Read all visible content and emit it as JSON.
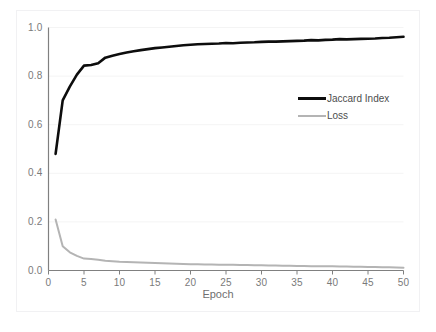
{
  "chart_data": {
    "type": "line",
    "title": "",
    "xlabel": "Epoch",
    "ylabel": "",
    "xlim": [
      0,
      50
    ],
    "ylim": [
      0,
      1.0
    ],
    "grid": true,
    "grid_axis": "y",
    "legend_position": "inside-upper-right",
    "x_ticks": [
      0,
      5,
      10,
      15,
      20,
      25,
      30,
      35,
      40,
      45,
      50
    ],
    "x_tick_labels": [
      "0",
      "5",
      "10",
      "15",
      "20",
      "25",
      "30",
      "35",
      "40",
      "45",
      "50"
    ],
    "y_ticks": [
      0.0,
      0.2,
      0.4,
      0.6,
      0.8,
      1.0
    ],
    "y_tick_labels": [
      "0.0",
      "0.2",
      "0.4",
      "0.6",
      "0.8",
      "1.0"
    ],
    "x": [
      1,
      2,
      3,
      4,
      5,
      6,
      7,
      8,
      9,
      10,
      11,
      12,
      13,
      14,
      15,
      16,
      17,
      18,
      19,
      20,
      21,
      22,
      23,
      24,
      25,
      26,
      27,
      28,
      29,
      30,
      31,
      32,
      33,
      34,
      35,
      36,
      37,
      38,
      39,
      40,
      41,
      42,
      43,
      44,
      45,
      46,
      47,
      48,
      49,
      50
    ],
    "series": [
      {
        "name": "Jaccard Index",
        "color": "#0d0d0d",
        "line_width": 2.6,
        "values": [
          0.48,
          0.7,
          0.757,
          0.806,
          0.843,
          0.846,
          0.853,
          0.876,
          0.884,
          0.891,
          0.897,
          0.902,
          0.907,
          0.911,
          0.915,
          0.918,
          0.921,
          0.924,
          0.927,
          0.929,
          0.931,
          0.932,
          0.933,
          0.934,
          0.936,
          0.935,
          0.937,
          0.938,
          0.939,
          0.941,
          0.942,
          0.942,
          0.943,
          0.944,
          0.945,
          0.946,
          0.948,
          0.947,
          0.949,
          0.95,
          0.952,
          0.951,
          0.952,
          0.953,
          0.954,
          0.955,
          0.957,
          0.958,
          0.96,
          0.962
        ]
      },
      {
        "name": "Loss",
        "color": "#b4b4b4",
        "line_width": 2.0,
        "values": [
          0.21,
          0.1,
          0.075,
          0.06,
          0.049,
          0.047,
          0.044,
          0.04,
          0.038,
          0.036,
          0.035,
          0.034,
          0.033,
          0.032,
          0.031,
          0.03,
          0.029,
          0.028,
          0.027,
          0.026,
          0.026,
          0.025,
          0.025,
          0.024,
          0.024,
          0.024,
          0.023,
          0.023,
          0.022,
          0.022,
          0.021,
          0.021,
          0.02,
          0.02,
          0.019,
          0.019,
          0.018,
          0.018,
          0.017,
          0.017,
          0.016,
          0.016,
          0.015,
          0.015,
          0.014,
          0.014,
          0.013,
          0.013,
          0.012,
          0.011
        ]
      }
    ]
  },
  "legend": {
    "entries": [
      {
        "label": "Jaccard Index"
      },
      {
        "label": "Loss"
      }
    ]
  },
  "axis": {
    "x_title": "Epoch"
  },
  "colors": {
    "jaccard": "#0d0d0d",
    "loss": "#b4b4b4",
    "axis_line": "#808080",
    "gridline": "#f4f4f4",
    "tick_text": "#7a7a7a"
  }
}
